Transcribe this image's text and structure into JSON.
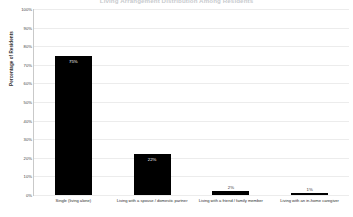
{
  "chart_data": {
    "type": "bar",
    "title": "Living Arrangement Distribution Among Residents",
    "xlabel": "",
    "ylabel": "Percentage of Residents",
    "categories": [
      "Single (living alone)",
      "Living with a spouse / domestic partner",
      "Living with a friend / family member",
      "Living with an in-home caregiver"
    ],
    "values": [
      75,
      22,
      2,
      1
    ],
    "value_labels": [
      "75%",
      "22%",
      "2%",
      "1%"
    ],
    "ylim": [
      0,
      100
    ],
    "ytick_labels": [
      "0%",
      "10%",
      "20%",
      "30%",
      "40%",
      "50%",
      "60%",
      "70%",
      "80%",
      "90%",
      "100%"
    ],
    "ytick_values": [
      0,
      10,
      20,
      30,
      40,
      50,
      60,
      70,
      80,
      90,
      100
    ],
    "grid": true,
    "legend": "none",
    "bar_color": "#000000"
  }
}
